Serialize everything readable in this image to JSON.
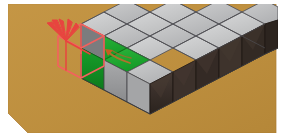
{
  "scene": {
    "title": "Isometric voxel grid with highlighted block and removal indicator",
    "canvas": {
      "width": 284,
      "height": 137
    },
    "background_color": "#ffffff",
    "ground": {
      "label": "ground-plane",
      "color": "#bf9140",
      "edge_color": "#a8762f",
      "polygon": "8,4 276,4 276,133 28,133 8,113"
    },
    "projection": {
      "type": "isometric",
      "tile_half_width": 23,
      "tile_half_height": 12,
      "cube_height": 30,
      "origin_x": 104,
      "origin_y": 47
    },
    "grid": {
      "label": "voxel-slab",
      "columns": 5,
      "rows": 3,
      "layers": 1,
      "total_cubes": 15
    },
    "face_colors": {
      "top_default": "#c9cacb",
      "top_highlight": "#21a532",
      "top_shadow": "#b2b3b4",
      "left_default": "#8f9092",
      "left_highlight": "#179c28",
      "left_dark": "#6f7072",
      "right_default": "#3a2f2b",
      "right_dark": "#2e2520",
      "edge": "#4a4a4a",
      "edge_light": "#6a6a6a"
    },
    "selection": {
      "label": "removal-target",
      "wireframe_color": "#f4615e",
      "wireframe_width": 1.6,
      "burst_color": "#e8443f",
      "burst_rays": 5,
      "burst_center_x": 66,
      "burst_center_y": 41
    },
    "arrow": {
      "label": "move-direction-arrow",
      "color": "#b8702f",
      "head_color": "#c4601f",
      "direction": "up-left"
    },
    "highlight_cubes": [
      {
        "col": 0,
        "row": 1,
        "state": "selected-green"
      },
      {
        "col": 1,
        "row": 1,
        "state": "top-green"
      }
    ],
    "legend": {
      "green_label": "selected block",
      "red_label": "ghost / removed block",
      "gray_label": "stone block",
      "dark_label": "shadowed face"
    }
  }
}
